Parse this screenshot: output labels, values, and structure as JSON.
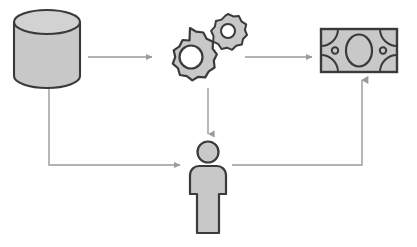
{
  "diagram": {
    "canvas": {
      "width": 417,
      "height": 247,
      "background": "#ffffff"
    },
    "colors": {
      "fill": "#c8c8c8",
      "fill_light": "#d2d2d2",
      "stroke": "#3a3a3a",
      "connector": "#9a9a9a",
      "white": "#ffffff"
    },
    "nodes": [
      {
        "id": "database",
        "label": "Database",
        "icon": "database-cylinder-icon",
        "x": 14,
        "y": 10,
        "width": 66,
        "height": 78
      },
      {
        "id": "gears",
        "label": "Processing Gears",
        "icon": "gears-icon",
        "x": 152,
        "y": 14,
        "width": 92,
        "height": 76,
        "gear_large": {
          "cx": 190,
          "cy": 57,
          "teeth": 10,
          "outer_r": 28,
          "inner_r": 20,
          "hub_r": 11
        },
        "gear_small": {
          "cx": 228,
          "cy": 33,
          "teeth": 8,
          "outer_r": 19,
          "inner_r": 13,
          "hub_r": 7
        }
      },
      {
        "id": "money",
        "label": "Banknote",
        "icon": "money-banknote-icon",
        "x": 320,
        "y": 28,
        "width": 78,
        "height": 45
      },
      {
        "id": "person",
        "label": "User",
        "icon": "person-icon",
        "x": 186,
        "y": 141,
        "width": 44,
        "height": 93,
        "head": {
          "cx": 208,
          "cy": 152,
          "r": 11
        }
      }
    ],
    "connectors": [
      {
        "id": "db-to-gears",
        "label": "Database to Gears",
        "type": "arrow-right"
      },
      {
        "id": "gears-to-money",
        "label": "Gears to Money",
        "type": "arrow-right"
      },
      {
        "id": "gears-to-person",
        "label": "Gears to Person",
        "type": "arrow-down"
      },
      {
        "id": "db-to-person",
        "label": "Database to Person",
        "type": "elbow-arrow-right"
      },
      {
        "id": "person-to-money",
        "label": "Person to Money",
        "type": "elbow-arrow-up"
      }
    ]
  }
}
